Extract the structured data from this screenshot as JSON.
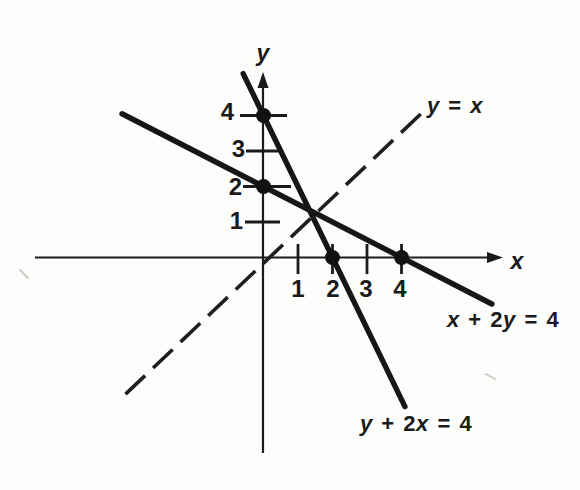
{
  "figure": {
    "bg_color": "#fdfdfb",
    "ink_color": "#1b1b1b",
    "canvas": {
      "width": 580,
      "height": 490
    }
  },
  "chart_data": {
    "type": "line",
    "title": "",
    "xlabel": "x",
    "ylabel": "y",
    "x_ticks": [
      1,
      2,
      3,
      4
    ],
    "y_ticks": [
      1,
      2,
      3,
      4
    ],
    "xlim": [
      -6.6,
      6.9
    ],
    "ylim": [
      -5.6,
      5.2
    ],
    "grid": false,
    "legend_position": "inline-labels",
    "series": [
      {
        "name": "x + 2y = 4",
        "style": "solid",
        "x": [
          -4.1,
          6.62
        ],
        "y": [
          4.05,
          -1.31
        ],
        "key_points": [
          [
            0,
            2
          ],
          [
            4,
            0
          ]
        ]
      },
      {
        "name": "y + 2x = 4",
        "style": "solid",
        "x": [
          -0.59,
          4.1
        ],
        "y": [
          5.18,
          -4.2
        ],
        "key_points": [
          [
            0,
            4
          ],
          [
            2,
            0
          ]
        ]
      },
      {
        "name": "y = x",
        "style": "dashed",
        "x": [
          -4.0,
          4.62
        ],
        "y": [
          -3.85,
          4.1
        ],
        "key_points": []
      }
    ],
    "marked_points": [
      [
        0,
        4
      ],
      [
        0,
        2
      ],
      [
        2,
        0
      ],
      [
        4,
        0
      ]
    ]
  },
  "labels": {
    "eq_x2y": {
      "a": "x",
      "b": " + 2",
      "c": "y",
      "d": " = 4"
    },
    "eq_y2x": {
      "a": "y",
      "b": " + 2",
      "c": "x",
      "d": " = 4"
    },
    "eq_yx": {
      "a": "y",
      "b": " = ",
      "c": "x"
    }
  },
  "layout": {
    "origin_px": [
      263.5,
      257.5
    ],
    "unit_px": [
      34.5,
      35.5
    ],
    "x_axis": {
      "x1": 35,
      "x2": 503,
      "y": 257.5
    },
    "y_axis": {
      "x": 263,
      "y1": 453,
      "y2": 72
    },
    "x_tick_span": [
      244,
      274
    ],
    "y_tick_spans": [
      [
        245,
        280
      ],
      [
        243,
        291
      ],
      [
        246,
        282
      ],
      [
        240,
        287
      ]
    ],
    "dot_radius": 7.5,
    "arrow": {
      "length": 16,
      "half_width": 5.5
    },
    "artifacts": [
      [
        20,
        270,
        28,
        278
      ],
      [
        486,
        374,
        495,
        379
      ]
    ]
  }
}
